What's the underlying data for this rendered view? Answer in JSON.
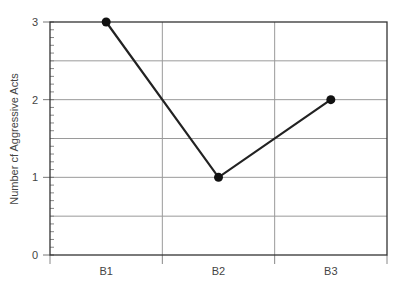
{
  "chart_data": {
    "type": "line",
    "title": "",
    "xlabel": "",
    "ylabel": "Number cf Aggressive Acts",
    "categories": [
      "B1",
      "B2",
      "B3"
    ],
    "series": [
      {
        "name": "Aggressive Acts",
        "values": [
          3,
          1,
          2
        ]
      }
    ],
    "ylim": [
      0,
      3
    ],
    "yticks": [
      0,
      1,
      2,
      3
    ],
    "ygrid": [
      0.5,
      1,
      1.5,
      2,
      2.5
    ],
    "grid": true,
    "legend": "none",
    "colors": {
      "line": "#222222",
      "marker": "#111111",
      "grid": "#9a9a9a",
      "frame": "#333333",
      "text": "#444444"
    }
  }
}
